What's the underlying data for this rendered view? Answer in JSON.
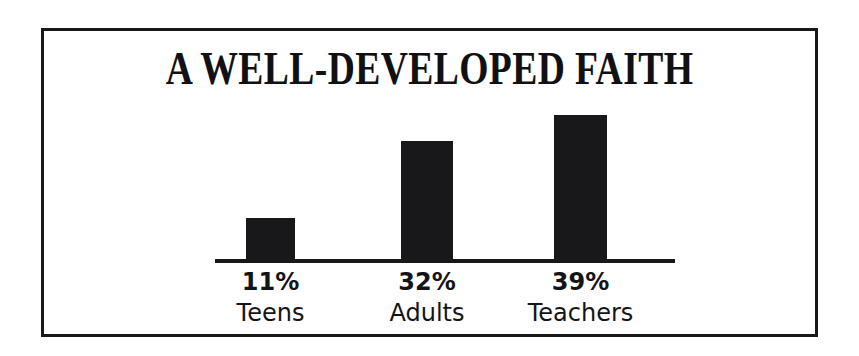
{
  "page": {
    "background_color": "#ffffff",
    "ink_color": "#18181a"
  },
  "frame": {
    "name": "chart-border",
    "border_color": "#18181a"
  },
  "chart_data": {
    "type": "bar",
    "title": "A WELL-DEVELOPED FAITH",
    "subtitle": "",
    "xlabel": "",
    "ylabel": "",
    "categories": [
      "Teens",
      "Adults",
      "Teachers"
    ],
    "values": [
      11,
      32,
      39
    ],
    "value_labels": [
      "11%",
      "32%",
      "39%"
    ],
    "unit": "%",
    "ylim": [
      0,
      45
    ],
    "grid": false,
    "legend": false,
    "legend_position": "none",
    "orientation": "vertical",
    "bar_color": "#18181a",
    "axis_color": "#18181a",
    "axis_line": "baseline-only",
    "bars": [
      {
        "category": "Teens",
        "value": 11,
        "value_label": "11%",
        "color": "#18181a"
      },
      {
        "category": "Adults",
        "value": 32,
        "value_label": "32%",
        "color": "#18181a"
      },
      {
        "category": "Teachers",
        "value": 39,
        "value_label": "39%",
        "color": "#18181a"
      }
    ]
  }
}
